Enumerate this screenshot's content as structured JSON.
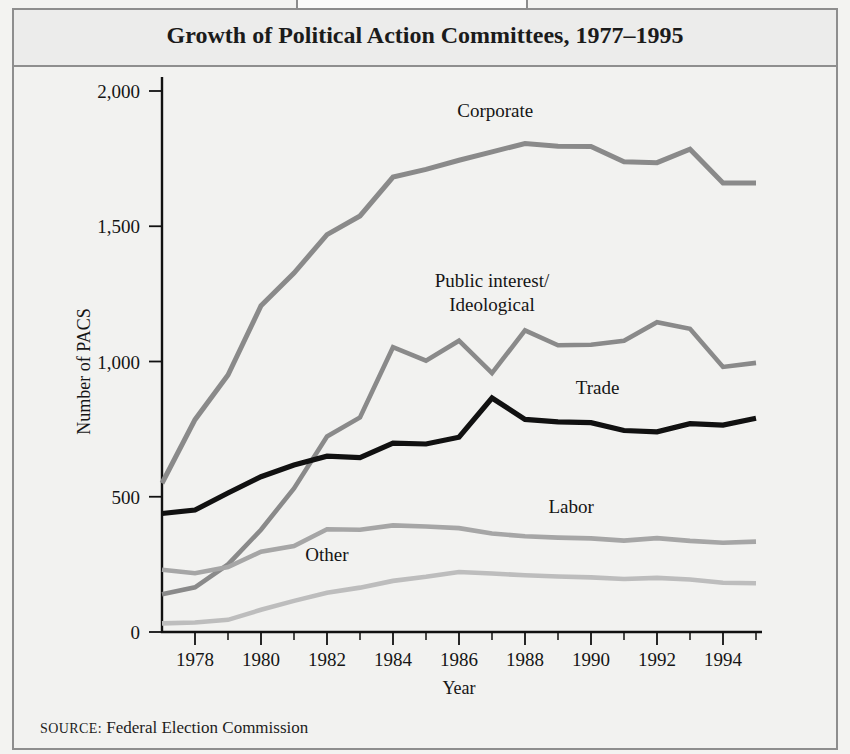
{
  "figure": {
    "tab_label": "FIGURE 12.2",
    "title": "Growth of Political Action Committees, 1977–1995",
    "source_keyword": "SOURCE:",
    "source_text": " Federal Election Commission"
  },
  "chart_data": {
    "type": "line",
    "title": "Growth of Political Action Committees, 1977–1995",
    "xlabel": "Year",
    "ylabel": "Number of PACS",
    "xlim": [
      1977,
      1995
    ],
    "ylim": [
      0,
      2000
    ],
    "grid": false,
    "legend_position": "inline-labels",
    "x": [
      1977,
      1978,
      1979,
      1980,
      1981,
      1982,
      1983,
      1984,
      1985,
      1986,
      1987,
      1988,
      1989,
      1990,
      1991,
      1992,
      1993,
      1994,
      1995
    ],
    "xticks": [
      1978,
      1980,
      1982,
      1984,
      1986,
      1988,
      1990,
      1992,
      1994
    ],
    "xticks_labels": [
      "1978",
      "1980",
      "1982",
      "1984",
      "1986",
      "1988",
      "1990",
      "1992",
      "1994"
    ],
    "yticks": [
      0,
      500,
      1000,
      1500,
      2000
    ],
    "yticks_labels": [
      "0",
      "500",
      "1,000",
      "1,500",
      "2,000"
    ],
    "series": [
      {
        "name": "Corporate",
        "color": "#8a8a8a",
        "width": 5.0,
        "label_x": 1987.1,
        "label_y": 1905,
        "values": [
          550,
          785,
          950,
          1206,
          1327,
          1469,
          1538,
          1682,
          1710,
          1744,
          1775,
          1806,
          1796,
          1795,
          1738,
          1735,
          1785,
          1660,
          1660
        ]
      },
      {
        "name": "Public interest/\nIdeological",
        "name_line1": "Public interest/",
        "name_line2": "Ideological",
        "color": "#8a8a8a",
        "width": 4.6,
        "label_x": 1987.0,
        "label_y": 1275,
        "values": [
          140,
          165,
          250,
          378,
          531,
          723,
          793,
          1053,
          1003,
          1077,
          957,
          1115,
          1060,
          1062,
          1077,
          1145,
          1121,
          980,
          995
        ]
      },
      {
        "name": "Trade",
        "color": "#111111",
        "width": 5.2,
        "label_x": 1990.2,
        "label_y": 880,
        "values": [
          438,
          451,
          514,
          574,
          617,
          650,
          645,
          698,
          695,
          720,
          865,
          786,
          777,
          774,
          745,
          740,
          770,
          765,
          790
        ]
      },
      {
        "name": "Labor",
        "color": "#a6a6a6",
        "width": 4.6,
        "label_x": 1989.4,
        "label_y": 440,
        "values": [
          230,
          217,
          240,
          297,
          318,
          380,
          378,
          394,
          390,
          384,
          364,
          354,
          349,
          346,
          338,
          347,
          337,
          330,
          334
        ]
      },
      {
        "name": "Other",
        "color": "#bdbdbd",
        "width": 4.6,
        "label_x": 1982.0,
        "label_y": 262,
        "values": [
          32,
          35,
          45,
          82,
          115,
          145,
          164,
          189,
          204,
          222,
          216,
          210,
          205,
          202,
          196,
          200,
          194,
          182,
          180
        ]
      }
    ]
  }
}
